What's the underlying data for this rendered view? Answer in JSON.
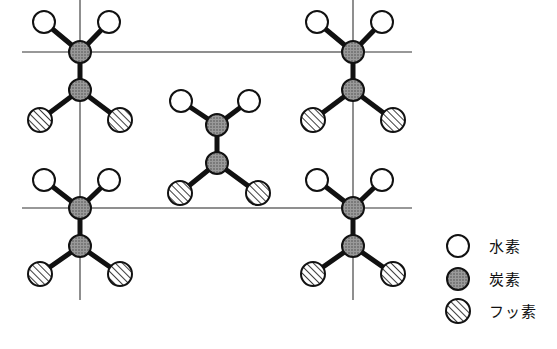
{
  "figure": {
    "title": "",
    "background_color": "#ffffff",
    "width": 557,
    "height": 349
  },
  "atom_styles": {
    "hydrogen": {
      "name": "hydrogen-atom",
      "label": "水素",
      "fill": "#ffffff",
      "stroke": "#111111",
      "radius": 11,
      "pattern": "open"
    },
    "carbon": {
      "name": "carbon-atom",
      "label": "炭素",
      "fill": "#8a8a8a",
      "stroke": "#111111",
      "radius": 11,
      "pattern": "stipple"
    },
    "fluorine": {
      "name": "fluorine-atom",
      "label": "フッ素",
      "fill": "#ffffff",
      "stroke": "#111111",
      "radius": 12,
      "pattern": "diagonal-hatch"
    }
  },
  "unit_cell": {
    "name": "unit-cell-rectangle",
    "stroke": "#333333",
    "stroke_width": 1.1,
    "left": 80,
    "right": 353,
    "top": 52,
    "bottom": 208
  },
  "bonds": {
    "stroke": "#111111",
    "stroke_width": 5,
    "chain_stroke_width": 3.5
  },
  "molecules": [
    {
      "id": "molecule-top-left",
      "label": "CH2-CF2 unit top left",
      "carbon_upper": {
        "x": 80,
        "y": 52
      },
      "carbon_lower": {
        "x": 80,
        "y": 90
      },
      "hydrogens": [
        {
          "x": 44,
          "y": 22
        },
        {
          "x": 109,
          "y": 22
        }
      ],
      "fluorines": [
        {
          "x": 40,
          "y": 120
        },
        {
          "x": 120,
          "y": 120
        }
      ]
    },
    {
      "id": "molecule-top-right",
      "label": "CH2-CF2 unit top right",
      "carbon_upper": {
        "x": 353,
        "y": 52
      },
      "carbon_lower": {
        "x": 353,
        "y": 90
      },
      "hydrogens": [
        {
          "x": 317,
          "y": 22
        },
        {
          "x": 382,
          "y": 22
        }
      ],
      "fluorines": [
        {
          "x": 313,
          "y": 120
        },
        {
          "x": 393,
          "y": 120
        }
      ]
    },
    {
      "id": "molecule-center",
      "label": "CH2-CF2 unit center",
      "carbon_upper": {
        "x": 217,
        "y": 125
      },
      "carbon_lower": {
        "x": 217,
        "y": 163
      },
      "hydrogens": [
        {
          "x": 181,
          "y": 101
        },
        {
          "x": 249,
          "y": 101
        }
      ],
      "fluorines": [
        {
          "x": 180,
          "y": 193
        },
        {
          "x": 258,
          "y": 193
        }
      ]
    },
    {
      "id": "molecule-bottom-left",
      "label": "CH2-CF2 unit bottom left",
      "carbon_upper": {
        "x": 80,
        "y": 208
      },
      "carbon_lower": {
        "x": 80,
        "y": 246
      },
      "hydrogens": [
        {
          "x": 44,
          "y": 180
        },
        {
          "x": 109,
          "y": 180
        }
      ],
      "fluorines": [
        {
          "x": 40,
          "y": 274
        },
        {
          "x": 120,
          "y": 274
        }
      ]
    },
    {
      "id": "molecule-bottom-right",
      "label": "CH2-CF2 unit bottom right",
      "carbon_upper": {
        "x": 353,
        "y": 208
      },
      "carbon_lower": {
        "x": 353,
        "y": 246
      },
      "hydrogens": [
        {
          "x": 317,
          "y": 180
        },
        {
          "x": 382,
          "y": 180
        }
      ],
      "fluorines": [
        {
          "x": 313,
          "y": 274
        },
        {
          "x": 393,
          "y": 274
        }
      ]
    }
  ],
  "chain_stubs": [
    {
      "id": "stub-top-left-up",
      "x1": 80,
      "y1": 52,
      "x2": 80,
      "y2": 0
    },
    {
      "id": "stub-top-right-up",
      "x1": 353,
      "y1": 52,
      "x2": 353,
      "y2": 0
    },
    {
      "id": "stub-bottom-left-down",
      "x1": 80,
      "y1": 246,
      "x2": 80,
      "y2": 300
    },
    {
      "id": "stub-bottom-right-down",
      "x1": 353,
      "y1": 246,
      "x2": 353,
      "y2": 300
    },
    {
      "id": "stub-top-right-edge",
      "x1": 353,
      "y1": 52,
      "x2": 412,
      "y2": 52
    },
    {
      "id": "stub-top-left-edge",
      "x1": 80,
      "y1": 52,
      "x2": 22,
      "y2": 52
    },
    {
      "id": "stub-bottom-right-edge",
      "x1": 353,
      "y1": 208,
      "x2": 412,
      "y2": 208
    },
    {
      "id": "stub-bottom-left-edge",
      "x1": 80,
      "y1": 208,
      "x2": 22,
      "y2": 208
    }
  ],
  "legend": {
    "name": "legend",
    "x_symbol": 458,
    "x_text": 489,
    "items": [
      {
        "key": "hydrogen",
        "label": "水素",
        "y": 246
      },
      {
        "key": "carbon",
        "label": "炭素",
        "y": 279
      },
      {
        "key": "fluorine",
        "label": "フッ素",
        "y": 311
      }
    ]
  }
}
